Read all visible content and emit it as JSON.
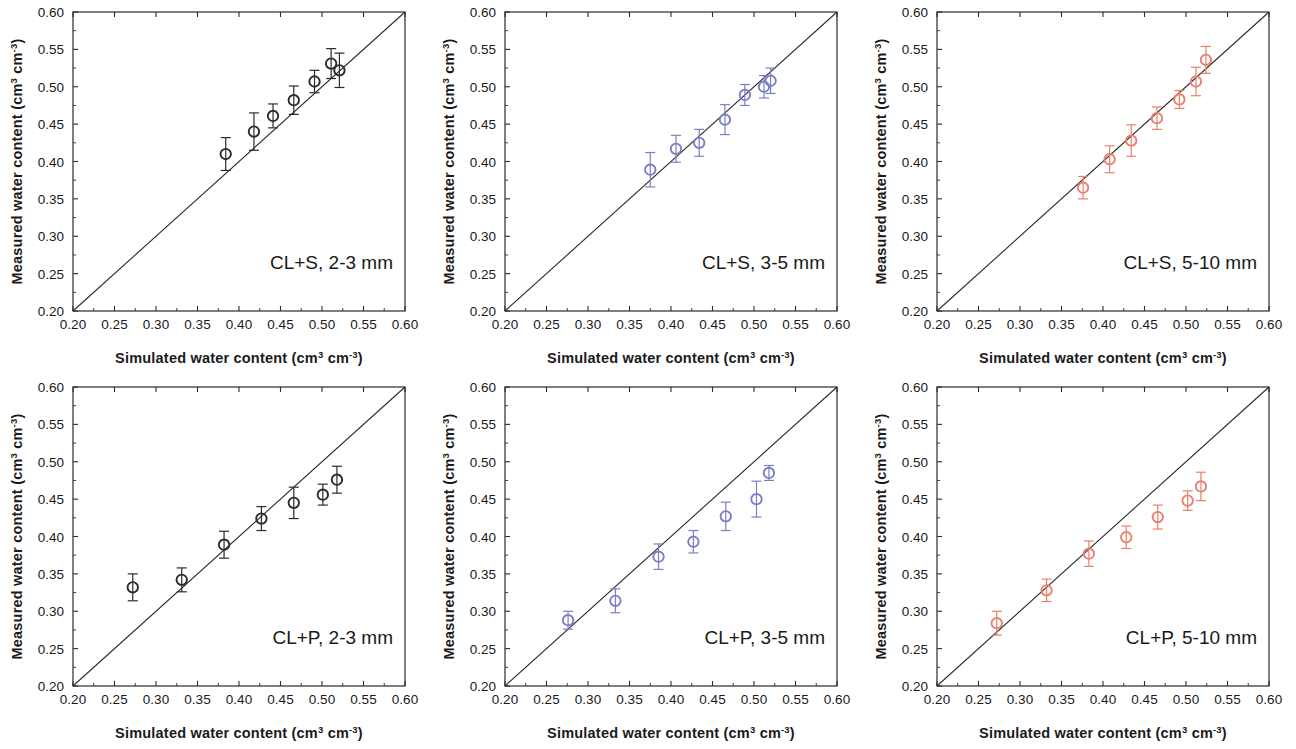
{
  "figure": {
    "width": 1296,
    "height": 749,
    "background": "#ffffff",
    "rows": 2,
    "columns": 3
  },
  "axes": {
    "x_title_prefix": "Simulated water content (cm",
    "x_title_sup1": "3",
    "x_title_mid": " cm",
    "x_title_sup2": "-3",
    "x_title_suffix": ")",
    "y_title_prefix": "Measured water content (cm",
    "y_title_sup1": "3",
    "y_title_mid": " cm",
    "y_title_sup2": "-3",
    "y_title_suffix": ")",
    "x_ticks": [
      "0.20",
      "0.25",
      "0.30",
      "0.35",
      "0.40",
      "0.45",
      "0.50",
      "0.55",
      "0.60"
    ],
    "y_ticks": [
      "0.20",
      "0.25",
      "0.30",
      "0.35",
      "0.40",
      "0.45",
      "0.50",
      "0.55",
      "0.60"
    ],
    "xlim": [
      0.2,
      0.6
    ],
    "ylim": [
      0.2,
      0.6
    ],
    "one_to_one_line": true
  },
  "colors": {
    "black": "#2b2b2b",
    "blue": "#7b7fc4",
    "salmon": "#e8806b",
    "frame": "#2b2b2b",
    "text": "#1a1a1a"
  },
  "chart_data": [
    {
      "type": "scatter",
      "id": "cl-s-2-3mm",
      "title": "CL+S, 2-3 mm",
      "xlabel": "Simulated water content (cm3 cm-3)",
      "ylabel": "Measured water content (cm3 cm-3)",
      "xlim": [
        0.2,
        0.6
      ],
      "ylim": [
        0.2,
        0.6
      ],
      "grid": false,
      "legend": "none",
      "marker": "open-circle",
      "color": "#2b2b2b",
      "reference_line": "1:1",
      "x": [
        0.384,
        0.418,
        0.441,
        0.466,
        0.491,
        0.511,
        0.521
      ],
      "y": [
        0.41,
        0.44,
        0.461,
        0.482,
        0.507,
        0.531,
        0.522
      ],
      "yerr": [
        0.022,
        0.025,
        0.016,
        0.019,
        0.015,
        0.02,
        0.023
      ]
    },
    {
      "type": "scatter",
      "id": "cl-s-3-5mm",
      "title": "CL+S, 3-5 mm",
      "xlabel": "Simulated water content (cm3 cm-3)",
      "ylabel": "Measured water content (cm3 cm-3)",
      "xlim": [
        0.2,
        0.6
      ],
      "ylim": [
        0.2,
        0.6
      ],
      "grid": false,
      "legend": "none",
      "marker": "open-circle",
      "color": "#7b7fc4",
      "reference_line": "1:1",
      "x": [
        0.375,
        0.406,
        0.434,
        0.465,
        0.489,
        0.512,
        0.52
      ],
      "y": [
        0.389,
        0.417,
        0.425,
        0.456,
        0.489,
        0.5,
        0.508
      ],
      "yerr": [
        0.023,
        0.018,
        0.018,
        0.02,
        0.014,
        0.015,
        0.017
      ]
    },
    {
      "type": "scatter",
      "id": "cl-s-5-10mm",
      "title": "CL+S, 5-10 mm",
      "xlabel": "Simulated water content (cm3 cm-3)",
      "ylabel": "Measured water content (cm3 cm-3)",
      "xlim": [
        0.2,
        0.6
      ],
      "ylim": [
        0.2,
        0.6
      ],
      "grid": false,
      "legend": "none",
      "marker": "open-circle",
      "color": "#e8806b",
      "reference_line": "1:1",
      "x": [
        0.376,
        0.408,
        0.434,
        0.465,
        0.492,
        0.512,
        0.524
      ],
      "y": [
        0.365,
        0.403,
        0.428,
        0.458,
        0.483,
        0.507,
        0.536
      ],
      "yerr": [
        0.015,
        0.018,
        0.021,
        0.015,
        0.012,
        0.019,
        0.018
      ]
    },
    {
      "type": "scatter",
      "id": "cl-p-2-3mm",
      "title": "CL+P, 2-3 mm",
      "xlabel": "Simulated water content (cm3 cm-3)",
      "ylabel": "Measured water content (cm3 cm-3)",
      "xlim": [
        0.2,
        0.6
      ],
      "ylim": [
        0.2,
        0.6
      ],
      "grid": false,
      "legend": "none",
      "marker": "open-circle",
      "color": "#2b2b2b",
      "reference_line": "1:1",
      "x": [
        0.272,
        0.331,
        0.382,
        0.427,
        0.466,
        0.501,
        0.518
      ],
      "y": [
        0.332,
        0.342,
        0.389,
        0.424,
        0.445,
        0.456,
        0.476
      ],
      "yerr": [
        0.018,
        0.016,
        0.018,
        0.016,
        0.021,
        0.014,
        0.018
      ]
    },
    {
      "type": "scatter",
      "id": "cl-p-3-5mm",
      "title": "CL+P, 3-5 mm",
      "xlabel": "Simulated water content (cm3 cm-3)",
      "ylabel": "Measured water content (cm3 cm-3)",
      "xlim": [
        0.2,
        0.6
      ],
      "ylim": [
        0.2,
        0.6
      ],
      "grid": false,
      "legend": "none",
      "marker": "open-circle",
      "color": "#7b7fc4",
      "reference_line": "1:1",
      "x": [
        0.276,
        0.333,
        0.385,
        0.427,
        0.466,
        0.503,
        0.518
      ],
      "y": [
        0.288,
        0.314,
        0.373,
        0.393,
        0.427,
        0.45,
        0.485
      ],
      "yerr": [
        0.012,
        0.016,
        0.017,
        0.015,
        0.019,
        0.024,
        0.01
      ]
    },
    {
      "type": "scatter",
      "id": "cl-p-5-10mm",
      "title": "CL+P, 5-10 mm",
      "xlabel": "Simulated water content (cm3 cm-3)",
      "ylabel": "Measured water content (cm3 cm-3)",
      "xlim": [
        0.2,
        0.6
      ],
      "ylim": [
        0.2,
        0.6
      ],
      "grid": false,
      "legend": "none",
      "marker": "open-circle",
      "color": "#e8806b",
      "reference_line": "1:1",
      "x": [
        0.272,
        0.332,
        0.383,
        0.428,
        0.466,
        0.502,
        0.518
      ],
      "y": [
        0.284,
        0.328,
        0.377,
        0.399,
        0.426,
        0.448,
        0.467
      ],
      "yerr": [
        0.016,
        0.015,
        0.017,
        0.015,
        0.016,
        0.013,
        0.019
      ]
    }
  ]
}
